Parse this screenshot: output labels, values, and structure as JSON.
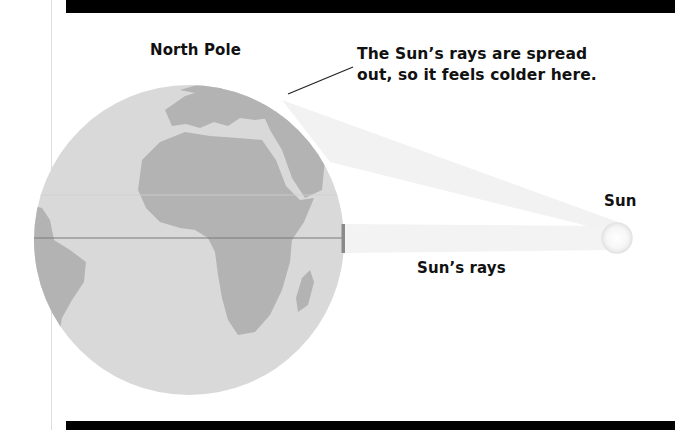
{
  "labels": {
    "north_pole": "North Pole",
    "callout_line1": "The Sun’s rays are spread",
    "callout_line2": "out, so it feels colder here.",
    "sun": "Sun",
    "sun_rays": "Sun’s rays"
  },
  "colors": {
    "ocean": "#d9d9d9",
    "land": "#b3b3b3",
    "ray_band": "#f3f3f3",
    "equator_line": "#7a7a7a",
    "frame_bar": "#000000",
    "text": "#111111"
  }
}
